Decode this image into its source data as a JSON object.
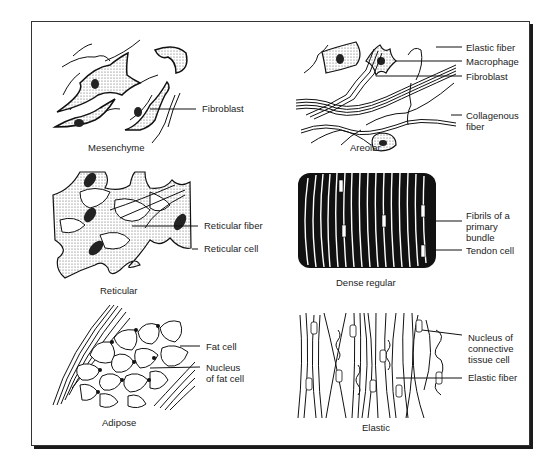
{
  "figure": {
    "panels": [
      {
        "caption": "Mesenchyme",
        "labels": [
          "Fibroblast"
        ]
      },
      {
        "caption": "Areolar",
        "labels": [
          "Elastic fiber",
          "Macrophage",
          "Fibroblast",
          "Collagenous\nfiber"
        ]
      },
      {
        "caption": "Reticular",
        "labels": [
          "Reticular fiber",
          "Reticular cell"
        ]
      },
      {
        "caption": "Dense regular",
        "labels": [
          "Fibrils of a\nprimary bundle",
          "Tendon cell"
        ]
      },
      {
        "caption": "Adipose",
        "labels": [
          "Fat cell",
          "Nucleus\nof fat cell"
        ]
      },
      {
        "caption": "Elastic",
        "labels": [
          "Nucleus of\nconnective\ntissue cell",
          "Elastic fiber"
        ]
      }
    ]
  }
}
